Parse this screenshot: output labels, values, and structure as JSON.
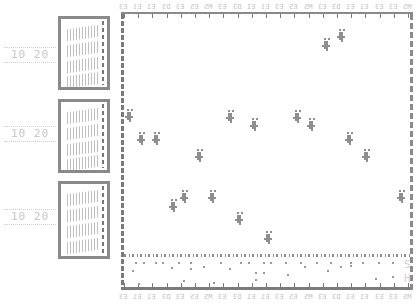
{
  "chart_data": {
    "type": "scatter",
    "title": "",
    "xlabel": "",
    "ylabel": "",
    "grid": false,
    "legend": "none",
    "top_tick_labels": [
      "E3",
      "E1",
      "E1",
      "D3",
      "E3",
      "E5",
      "M5",
      "E3",
      "D3",
      "E1",
      "E1",
      "E3",
      "E5",
      "M5",
      "E3",
      "D3",
      "E1",
      "E1",
      "E3",
      "E3",
      "M5"
    ],
    "bottom_tick_labels": [
      "E3",
      "E1",
      "E1",
      "D3",
      "E3",
      "E5",
      "M5",
      "E3",
      "D3",
      "E1",
      "E1",
      "E3",
      "E5",
      "M5",
      "E3",
      "D3",
      "E1",
      "E1",
      "E3",
      "E3",
      "M5"
    ],
    "side_panels": [
      {
        "label": "10 20",
        "y": 54
      },
      {
        "label": "10 20",
        "y": 132
      },
      {
        "label": "10 20",
        "y": 216
      }
    ],
    "right_labels": [
      "S",
      "H"
    ],
    "clusters": [
      {
        "x": 340,
        "y": 35
      },
      {
        "x": 325,
        "y": 44
      },
      {
        "x": 128,
        "y": 115
      },
      {
        "x": 140,
        "y": 138
      },
      {
        "x": 155,
        "y": 138
      },
      {
        "x": 198,
        "y": 155
      },
      {
        "x": 229,
        "y": 116
      },
      {
        "x": 253,
        "y": 124
      },
      {
        "x": 296,
        "y": 116
      },
      {
        "x": 310,
        "y": 124
      },
      {
        "x": 348,
        "y": 138
      },
      {
        "x": 365,
        "y": 155
      },
      {
        "x": 183,
        "y": 196
      },
      {
        "x": 172,
        "y": 205
      },
      {
        "x": 211,
        "y": 196
      },
      {
        "x": 238,
        "y": 218
      },
      {
        "x": 267,
        "y": 237
      },
      {
        "x": 400,
        "y": 196
      }
    ],
    "subpanel_dots": [
      {
        "x": 135,
        "y": 262
      },
      {
        "x": 143,
        "y": 262
      },
      {
        "x": 155,
        "y": 262
      },
      {
        "x": 162,
        "y": 262
      },
      {
        "x": 178,
        "y": 262
      },
      {
        "x": 190,
        "y": 262
      },
      {
        "x": 220,
        "y": 262
      },
      {
        "x": 240,
        "y": 262
      },
      {
        "x": 248,
        "y": 262
      },
      {
        "x": 263,
        "y": 262
      },
      {
        "x": 270,
        "y": 262
      },
      {
        "x": 285,
        "y": 262
      },
      {
        "x": 300,
        "y": 262
      },
      {
        "x": 316,
        "y": 262
      },
      {
        "x": 330,
        "y": 262
      },
      {
        "x": 350,
        "y": 262
      },
      {
        "x": 362,
        "y": 262
      },
      {
        "x": 378,
        "y": 262
      },
      {
        "x": 392,
        "y": 262
      },
      {
        "x": 132,
        "y": 270
      },
      {
        "x": 171,
        "y": 267
      },
      {
        "x": 190,
        "y": 268
      },
      {
        "x": 203,
        "y": 266
      },
      {
        "x": 229,
        "y": 268
      },
      {
        "x": 255,
        "y": 272
      },
      {
        "x": 263,
        "y": 272
      },
      {
        "x": 287,
        "y": 274
      },
      {
        "x": 304,
        "y": 266
      },
      {
        "x": 327,
        "y": 270
      },
      {
        "x": 340,
        "y": 266
      },
      {
        "x": 350,
        "y": 265
      },
      {
        "x": 375,
        "y": 278
      },
      {
        "x": 392,
        "y": 276
      },
      {
        "x": 183,
        "y": 280
      },
      {
        "x": 138,
        "y": 283
      },
      {
        "x": 213,
        "y": 282
      },
      {
        "x": 255,
        "y": 279
      }
    ]
  },
  "labels": {
    "side_1": "10 20",
    "side_2": "10 20",
    "side_3": "10 20",
    "right_top": "S",
    "right_bottom": "H",
    "corner_top": "E5"
  }
}
